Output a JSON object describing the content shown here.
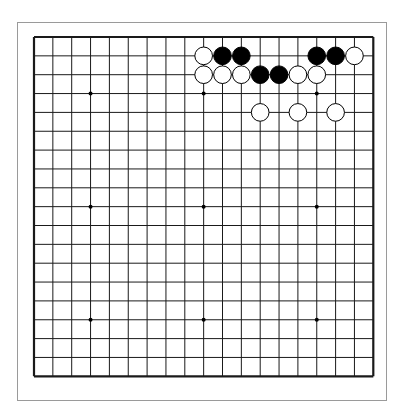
{
  "board": {
    "size": 19,
    "origin": [
      34,
      37
    ],
    "spacing": 18.85,
    "line_color": "#1a1a1a",
    "hoshi": [
      [
        3,
        3
      ],
      [
        9,
        3
      ],
      [
        15,
        3
      ],
      [
        3,
        9
      ],
      [
        9,
        9
      ],
      [
        15,
        9
      ],
      [
        3,
        15
      ],
      [
        9,
        15
      ],
      [
        15,
        15
      ]
    ],
    "stones": [
      {
        "col": 9,
        "row": 1,
        "color": "white"
      },
      {
        "col": 10,
        "row": 1,
        "color": "black"
      },
      {
        "col": 11,
        "row": 1,
        "color": "black"
      },
      {
        "col": 15,
        "row": 1,
        "color": "black"
      },
      {
        "col": 16,
        "row": 1,
        "color": "black"
      },
      {
        "col": 17,
        "row": 1,
        "color": "white"
      },
      {
        "col": 9,
        "row": 2,
        "color": "white"
      },
      {
        "col": 10,
        "row": 2,
        "color": "white"
      },
      {
        "col": 11,
        "row": 2,
        "color": "white"
      },
      {
        "col": 12,
        "row": 2,
        "color": "black"
      },
      {
        "col": 13,
        "row": 2,
        "color": "black"
      },
      {
        "col": 14,
        "row": 2,
        "color": "white"
      },
      {
        "col": 15,
        "row": 2,
        "color": "white"
      },
      {
        "col": 12,
        "row": 4,
        "color": "white"
      },
      {
        "col": 14,
        "row": 4,
        "color": "white"
      },
      {
        "col": 16,
        "row": 4,
        "color": "white"
      }
    ]
  }
}
